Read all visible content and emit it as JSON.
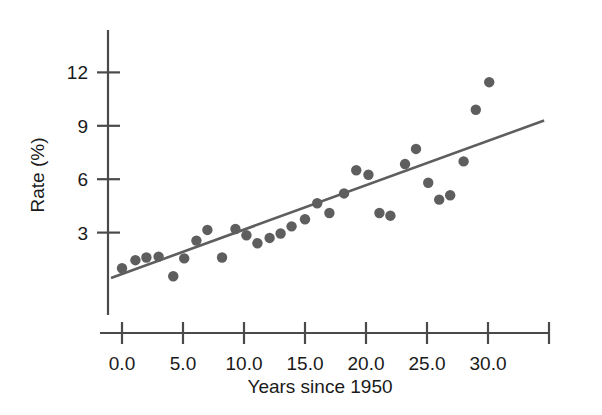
{
  "chart_data": {
    "type": "scatter",
    "title": "",
    "xlabel": "Years since 1950",
    "ylabel": "Rate (%)",
    "xlim": [
      -1.4,
      35.5
    ],
    "ylim": [
      0,
      13.2
    ],
    "grid": false,
    "legend": "none",
    "xticks": [
      "0.0",
      "5.0",
      "10.0",
      "15.0",
      "20.0",
      "25.0",
      "30.0"
    ],
    "xtick_values": [
      0,
      5,
      10,
      15,
      20,
      25,
      30
    ],
    "extra_xtick_value": 35,
    "yticks": [
      "3",
      "6",
      "9",
      "12"
    ],
    "ytick_values": [
      3,
      6,
      9,
      12
    ],
    "marker": {
      "shape": "circle",
      "color": "#5e5e5e",
      "radius": 5.2
    },
    "series": [
      {
        "name": "Rate",
        "points": [
          {
            "x": 0.0,
            "y": 1.0
          },
          {
            "x": 1.1,
            "y": 1.45
          },
          {
            "x": 2.0,
            "y": 1.6
          },
          {
            "x": 3.0,
            "y": 1.65
          },
          {
            "x": 4.2,
            "y": 0.55
          },
          {
            "x": 5.1,
            "y": 1.55
          },
          {
            "x": 6.1,
            "y": 2.55
          },
          {
            "x": 7.0,
            "y": 3.15
          },
          {
            "x": 8.2,
            "y": 1.6
          },
          {
            "x": 9.3,
            "y": 3.2
          },
          {
            "x": 10.2,
            "y": 2.85
          },
          {
            "x": 11.1,
            "y": 2.4
          },
          {
            "x": 12.1,
            "y": 2.7
          },
          {
            "x": 13.0,
            "y": 2.95
          },
          {
            "x": 13.9,
            "y": 3.35
          },
          {
            "x": 15.0,
            "y": 3.75
          },
          {
            "x": 16.0,
            "y": 4.65
          },
          {
            "x": 17.0,
            "y": 4.1
          },
          {
            "x": 18.2,
            "y": 5.2
          },
          {
            "x": 19.2,
            "y": 6.5
          },
          {
            "x": 20.2,
            "y": 6.25
          },
          {
            "x": 21.1,
            "y": 4.1
          },
          {
            "x": 22.0,
            "y": 3.95
          },
          {
            "x": 23.2,
            "y": 6.85
          },
          {
            "x": 24.1,
            "y": 7.7
          },
          {
            "x": 25.1,
            "y": 5.8
          },
          {
            "x": 26.0,
            "y": 4.85
          },
          {
            "x": 26.9,
            "y": 5.1
          },
          {
            "x": 28.0,
            "y": 7.0
          },
          {
            "x": 29.0,
            "y": 9.9
          },
          {
            "x": 30.1,
            "y": 11.45
          }
        ]
      }
    ],
    "trendline": {
      "name": "regression-line",
      "color": "#5e5e5e",
      "x_start": -0.9,
      "y_start": 0.45,
      "x_end": 34.6,
      "y_end": 9.3
    }
  }
}
